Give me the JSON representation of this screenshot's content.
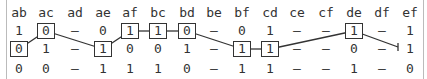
{
  "columns": [
    "ab",
    "ac",
    "ad",
    "ae",
    "af",
    "bc",
    "bd",
    "be",
    "bf",
    "cd",
    "ce",
    "cf",
    "de",
    "df",
    "ef"
  ],
  "rows": [
    [
      "1",
      "0",
      "–",
      "0",
      "1",
      "1",
      "0",
      "–",
      "0",
      "1",
      "–",
      "–",
      "1",
      "–",
      "1"
    ],
    [
      "0",
      "1",
      "–",
      "1",
      "0",
      "0",
      "1",
      "–",
      "1",
      "1",
      "–",
      "–",
      "0",
      "–",
      "1"
    ],
    [
      "0",
      "0",
      "–",
      "1",
      "1",
      "1",
      "0",
      "–",
      "1",
      "1",
      "–",
      "–",
      "1",
      "–",
      "0"
    ]
  ],
  "path": [
    {
      "row": 1,
      "col": 0
    },
    {
      "row": 0,
      "col": 1
    },
    {
      "row": 1,
      "col": 3
    },
    {
      "row": 0,
      "col": 4
    },
    {
      "row": 0,
      "col": 5
    },
    {
      "row": 0,
      "col": 6
    },
    {
      "row": 1,
      "col": 8
    },
    {
      "row": 1,
      "col": 9
    },
    {
      "row": 0,
      "col": 12
    },
    {
      "row": 1,
      "col": 14,
      "endpoint": true
    }
  ]
}
